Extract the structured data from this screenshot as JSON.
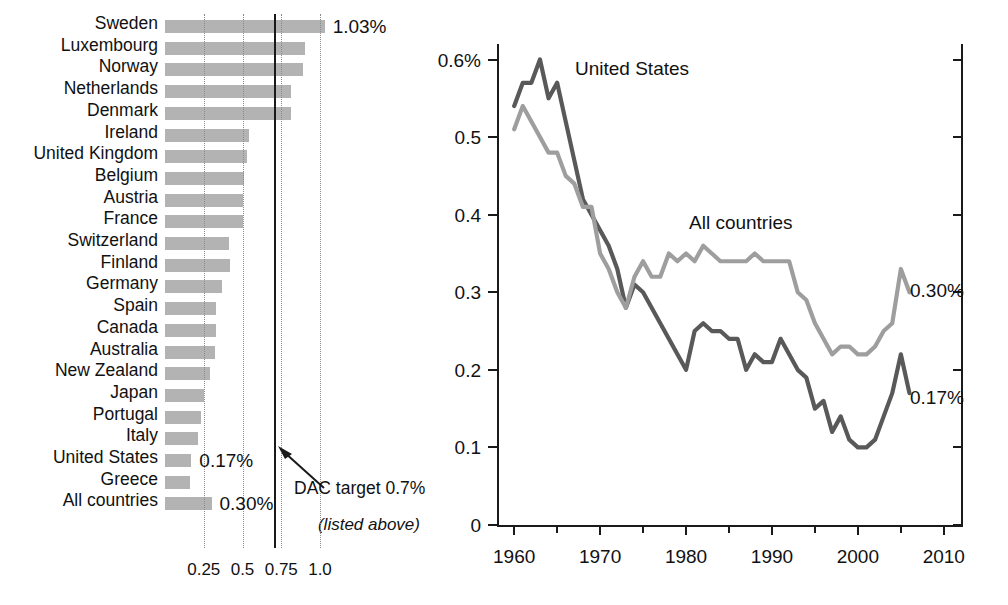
{
  "chart_data": [
    {
      "type": "bar",
      "orientation": "horizontal",
      "title": "",
      "xlabel": "",
      "ylabel": "",
      "xlim": [
        0,
        1.12
      ],
      "grid": true,
      "xticks": [
        0.25,
        0.5,
        0.75,
        1.0
      ],
      "xtick_labels": [
        "0.25",
        "0.5",
        "0.75",
        "1.0"
      ],
      "reference_line": {
        "value": 0.7,
        "label": "DAC target 0.7%"
      },
      "categories": [
        "Sweden",
        "Luxembourg",
        "Norway",
        "Netherlands",
        "Denmark",
        "Ireland",
        "United Kingdom",
        "Belgium",
        "Austria",
        "France",
        "Switzerland",
        "Finland",
        "Germany",
        "Spain",
        "Canada",
        "Australia",
        "New Zealand",
        "Japan",
        "Portugal",
        "Italy",
        "United States",
        "Greece",
        "All countries"
      ],
      "category_subtitle": "(listed above)",
      "values": [
        1.03,
        0.9,
        0.89,
        0.81,
        0.81,
        0.54,
        0.53,
        0.51,
        0.5,
        0.5,
        0.41,
        0.42,
        0.37,
        0.33,
        0.33,
        0.32,
        0.29,
        0.25,
        0.23,
        0.21,
        0.17,
        0.16,
        0.3
      ],
      "value_labels": [
        {
          "category": "Sweden",
          "text": "1.03%"
        },
        {
          "category": "United States",
          "text": "0.17%"
        },
        {
          "category": "All countries",
          "text": "0.30%"
        }
      ]
    },
    {
      "type": "line",
      "title": "",
      "xlabel": "",
      "ylabel": "",
      "xlim": [
        1958,
        2012
      ],
      "ylim": [
        0,
        0.62
      ],
      "yticks": [
        0,
        0.1,
        0.2,
        0.3,
        0.4,
        0.5,
        0.6
      ],
      "ytick_labels": [
        "0",
        "0.1",
        "0.2",
        "0.3",
        "0.4",
        "0.5",
        "0.6%"
      ],
      "xticks": [
        1960,
        1970,
        1980,
        1990,
        2000,
        2010
      ],
      "xtick_labels": [
        "1960",
        "1970",
        "1980",
        "1990",
        "2000",
        "2010"
      ],
      "xminor_ticks": [
        1965,
        1975,
        1985,
        1995,
        2005
      ],
      "grid": false,
      "legend_position": "inline-annotations",
      "series": [
        {
          "name": "United States",
          "color": "#595959",
          "end_label": "0.17%",
          "x": [
            1960,
            1961,
            1962,
            1963,
            1964,
            1965,
            1966,
            1967,
            1968,
            1969,
            1970,
            1971,
            1972,
            1973,
            1974,
            1975,
            1976,
            1977,
            1978,
            1979,
            1980,
            1981,
            1982,
            1983,
            1984,
            1985,
            1986,
            1987,
            1988,
            1989,
            1990,
            1991,
            1992,
            1993,
            1994,
            1995,
            1996,
            1997,
            1998,
            1999,
            2000,
            2001,
            2002,
            2003,
            2004,
            2005,
            2006
          ],
          "values": [
            0.54,
            0.57,
            0.57,
            0.6,
            0.55,
            0.57,
            0.52,
            0.47,
            0.42,
            0.4,
            0.38,
            0.36,
            0.33,
            0.28,
            0.31,
            0.3,
            0.28,
            0.26,
            0.24,
            0.22,
            0.2,
            0.25,
            0.26,
            0.25,
            0.25,
            0.24,
            0.24,
            0.2,
            0.22,
            0.21,
            0.21,
            0.24,
            0.22,
            0.2,
            0.19,
            0.15,
            0.16,
            0.12,
            0.14,
            0.11,
            0.1,
            0.1,
            0.11,
            0.14,
            0.17,
            0.22,
            0.17
          ]
        },
        {
          "name": "All countries",
          "color": "#9e9e9e",
          "end_label": "0.30%",
          "x": [
            1960,
            1961,
            1962,
            1963,
            1964,
            1965,
            1966,
            1967,
            1968,
            1969,
            1970,
            1971,
            1972,
            1973,
            1974,
            1975,
            1976,
            1977,
            1978,
            1979,
            1980,
            1981,
            1982,
            1983,
            1984,
            1985,
            1986,
            1987,
            1988,
            1989,
            1990,
            1991,
            1992,
            1993,
            1994,
            1995,
            1996,
            1997,
            1998,
            1999,
            2000,
            2001,
            2002,
            2003,
            2004,
            2005,
            2006
          ],
          "values": [
            0.51,
            0.54,
            0.52,
            0.5,
            0.48,
            0.48,
            0.45,
            0.44,
            0.41,
            0.41,
            0.35,
            0.33,
            0.3,
            0.28,
            0.32,
            0.34,
            0.32,
            0.32,
            0.35,
            0.34,
            0.35,
            0.34,
            0.36,
            0.35,
            0.34,
            0.34,
            0.34,
            0.34,
            0.35,
            0.34,
            0.34,
            0.34,
            0.34,
            0.3,
            0.29,
            0.26,
            0.24,
            0.22,
            0.23,
            0.23,
            0.22,
            0.22,
            0.23,
            0.25,
            0.26,
            0.33,
            0.3
          ]
        }
      ],
      "annotations": [
        {
          "text": "United States",
          "x": 1968,
          "y": 0.555
        },
        {
          "text": "All countries",
          "x": 1983,
          "y": 0.375
        }
      ]
    }
  ],
  "bar_chart": {
    "rows": [
      {
        "label": "Sweden",
        "value_text": "1.03%"
      },
      {
        "label": "Luxembourg",
        "value_text": ""
      },
      {
        "label": "Norway",
        "value_text": ""
      },
      {
        "label": "Netherlands",
        "value_text": ""
      },
      {
        "label": "Denmark",
        "value_text": ""
      },
      {
        "label": "Ireland",
        "value_text": ""
      },
      {
        "label": "United Kingdom",
        "value_text": ""
      },
      {
        "label": "Belgium",
        "value_text": ""
      },
      {
        "label": "Austria",
        "value_text": ""
      },
      {
        "label": "France",
        "value_text": ""
      },
      {
        "label": "Switzerland",
        "value_text": ""
      },
      {
        "label": "Finland",
        "value_text": ""
      },
      {
        "label": "Germany",
        "value_text": ""
      },
      {
        "label": "Spain",
        "value_text": ""
      },
      {
        "label": "Canada",
        "value_text": ""
      },
      {
        "label": "Australia",
        "value_text": ""
      },
      {
        "label": "New Zealand",
        "value_text": ""
      },
      {
        "label": "Japan",
        "value_text": ""
      },
      {
        "label": "Portugal",
        "value_text": ""
      },
      {
        "label": "Italy",
        "value_text": ""
      },
      {
        "label": "United States",
        "value_text": "0.17%"
      },
      {
        "label": "Greece",
        "value_text": ""
      },
      {
        "label": "All countries",
        "value_text": "0.30%"
      }
    ],
    "subtitle": "(listed above)",
    "ticks": [
      "0.25",
      "0.5",
      "0.75",
      "1.0"
    ],
    "target_note": "DAC target 0.7%",
    "colors": {
      "bar": "#b3b3b3",
      "grid": "#8a8a8a",
      "target_line": "#1a1a1a"
    }
  },
  "line_chart": {
    "y_labels": [
      "0.6%",
      "0.5",
      "0.4",
      "0.3",
      "0.2",
      "0.1",
      "0"
    ],
    "x_labels": [
      "1960",
      "1970",
      "1980",
      "1990",
      "2000",
      "2010"
    ],
    "series_labels": {
      "us": "United States",
      "all": "All countries"
    },
    "end_labels": {
      "all": "0.30%",
      "us": "0.17%"
    },
    "colors": {
      "us": "#595959",
      "all": "#9e9e9e",
      "axis": "#1a1a1a"
    }
  }
}
